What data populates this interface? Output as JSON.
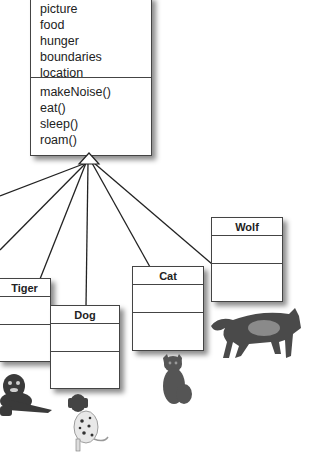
{
  "superclass": {
    "attributes": [
      "picture",
      "food",
      "hunger",
      "boundaries",
      "location"
    ],
    "methods": [
      "makeNoise()",
      "eat()",
      "sleep()",
      "roam()"
    ]
  },
  "subclasses": [
    {
      "name": "Tiger"
    },
    {
      "name": "Dog"
    },
    {
      "name": "Cat"
    },
    {
      "name": "Wolf"
    }
  ],
  "animals": [
    "tiger",
    "dalmatian dog",
    "tabby cat",
    "wolf"
  ]
}
